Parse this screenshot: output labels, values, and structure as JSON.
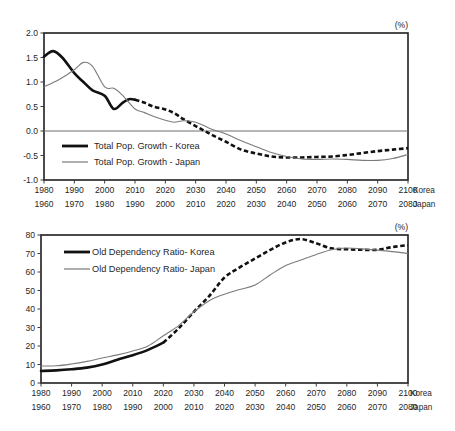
{
  "chart_data": [
    {
      "id": "total-population-growth",
      "type": "line",
      "title": "",
      "unit_label": "(%)",
      "xlabel": "",
      "ylabel": "",
      "ylim": [
        -1.0,
        2.0
      ],
      "yticks": [
        -1.0,
        -0.5,
        0.0,
        0.5,
        1.0,
        1.5,
        2.0
      ],
      "ytick_labels": [
        "-1.0",
        "-0.5",
        "0.0",
        "0.5",
        "1.0",
        "1.5",
        "2.0"
      ],
      "grid": false,
      "zero_line": true,
      "legend_position": "inside-lower-left",
      "x_axis_korea": {
        "label": "Korea",
        "ticks": [
          1980,
          1990,
          2000,
          2010,
          2020,
          2030,
          2040,
          2050,
          2060,
          2070,
          2080,
          2090,
          2100
        ],
        "tick_labels": [
          "1980",
          "1990",
          "2000",
          "2010",
          "2020",
          "2030",
          "2040",
          "2050",
          "2060",
          "2070",
          "2080",
          "2090",
          "2100"
        ]
      },
      "x_axis_japan": {
        "label": "Japan",
        "ticks": [
          1960,
          1970,
          1980,
          1990,
          2000,
          2010,
          2020,
          2030,
          2040,
          2050,
          2060,
          2070,
          2080
        ],
        "tick_labels": [
          "1960",
          "1970",
          "1980",
          "1990",
          "2000",
          "2010",
          "2020",
          "2030",
          "2040",
          "2050",
          "2060",
          "2070",
          "2080"
        ]
      },
      "series": [
        {
          "name": "Total Pop. Growth - Korea",
          "style": "thick-black",
          "observed_until": 2010,
          "x": [
            1980,
            1983,
            1986,
            1990,
            1993,
            1996,
            2000,
            2003,
            2006,
            2008,
            2010,
            2013,
            2016,
            2020,
            2023,
            2026,
            2030,
            2033,
            2036,
            2040,
            2045,
            2050,
            2055,
            2060,
            2065,
            2070,
            2075,
            2080,
            2085,
            2090,
            2095,
            2100
          ],
          "values": [
            1.52,
            1.63,
            1.5,
            1.18,
            1.0,
            0.83,
            0.72,
            0.45,
            0.58,
            0.65,
            0.64,
            0.58,
            0.5,
            0.44,
            0.36,
            0.24,
            0.1,
            0.0,
            -0.1,
            -0.22,
            -0.38,
            -0.46,
            -0.52,
            -0.54,
            -0.54,
            -0.53,
            -0.52,
            -0.49,
            -0.45,
            -0.41,
            -0.38,
            -0.35
          ]
        },
        {
          "name": "Total Pop. Growth - Japan",
          "style": "thin-gray",
          "x": [
            1960,
            1965,
            1970,
            1973,
            1976,
            1980,
            1983,
            1986,
            1990,
            1993,
            1996,
            2000,
            2003,
            2006,
            2010,
            2013,
            2016,
            2020,
            2025,
            2030,
            2035,
            2040,
            2045,
            2050,
            2055,
            2060,
            2065,
            2070,
            2075,
            2080
          ],
          "values": [
            0.9,
            1.05,
            1.25,
            1.4,
            1.32,
            0.9,
            0.87,
            0.72,
            0.45,
            0.38,
            0.3,
            0.22,
            0.18,
            0.21,
            0.18,
            0.1,
            0.02,
            -0.06,
            -0.2,
            -0.32,
            -0.44,
            -0.52,
            -0.57,
            -0.58,
            -0.57,
            -0.58,
            -0.6,
            -0.6,
            -0.56,
            -0.48
          ]
        }
      ],
      "legend": [
        {
          "label": "Total Pop. Growth - Korea",
          "style": "thick-black"
        },
        {
          "label": "Total Pop. Growth - Japan",
          "style": "thin-gray"
        }
      ]
    },
    {
      "id": "old-dependency-ratio",
      "type": "line",
      "title": "",
      "unit_label": "(%)",
      "xlabel": "",
      "ylabel": "",
      "ylim": [
        0,
        80
      ],
      "yticks": [
        0,
        10,
        20,
        30,
        40,
        50,
        60,
        70,
        80
      ],
      "ytick_labels": [
        "0",
        "10",
        "20",
        "30",
        "40",
        "50",
        "60",
        "70",
        "80"
      ],
      "grid": false,
      "zero_line": false,
      "legend_position": "inside-upper-left",
      "x_axis_korea": {
        "label": "Korea",
        "ticks": [
          1980,
          1990,
          2000,
          2010,
          2020,
          2030,
          2040,
          2050,
          2060,
          2070,
          2080,
          2090,
          2100
        ],
        "tick_labels": [
          "1980",
          "1990",
          "2000",
          "2010",
          "2020",
          "2030",
          "2040",
          "2050",
          "2060",
          "2070",
          "2080",
          "2090",
          "2100"
        ]
      },
      "x_axis_japan": {
        "label": "Japan",
        "ticks": [
          1960,
          1970,
          1980,
          1990,
          2000,
          2010,
          2020,
          2030,
          2040,
          2050,
          2060,
          2070,
          2080
        ],
        "tick_labels": [
          "1960",
          "1970",
          "1980",
          "1990",
          "2000",
          "2010",
          "2020",
          "2030",
          "2040",
          "2050",
          "2060",
          "2070",
          "2080"
        ]
      },
      "series": [
        {
          "name": "Old Dependency Ratio- Korea",
          "style": "thick-black",
          "observed_until": 2020,
          "x": [
            1980,
            1985,
            1990,
            1995,
            2000,
            2005,
            2010,
            2015,
            2020,
            2025,
            2030,
            2035,
            2040,
            2045,
            2050,
            2055,
            2060,
            2065,
            2070,
            2075,
            2080,
            2085,
            2090,
            2095,
            2100
          ],
          "values": [
            6.5,
            6.8,
            7.4,
            8.3,
            10.0,
            12.6,
            15.0,
            17.9,
            21.8,
            29.5,
            38.5,
            47.0,
            57.0,
            62.5,
            67.3,
            72.0,
            76.0,
            77.8,
            75.5,
            72.8,
            72.3,
            72.0,
            72.0,
            73.5,
            74.5
          ]
        },
        {
          "name": "Old Dependency Ratio- Japan",
          "style": "thin-gray",
          "x": [
            1960,
            1965,
            1970,
            1975,
            1980,
            1985,
            1990,
            1995,
            2000,
            2005,
            2010,
            2015,
            2020,
            2025,
            2030,
            2035,
            2040,
            2045,
            2050,
            2055,
            2060,
            2065,
            2070,
            2075,
            2080
          ],
          "values": [
            9.2,
            9.3,
            10.3,
            11.7,
            13.5,
            15.2,
            17.3,
            20.0,
            25.5,
            31.0,
            38.5,
            44.5,
            48.0,
            50.5,
            53.0,
            58.5,
            63.5,
            66.5,
            69.5,
            72.0,
            73.0,
            72.5,
            71.8,
            71.0,
            70.0
          ]
        }
      ],
      "legend": [
        {
          "label": "Old Dependency Ratio- Korea",
          "style": "thick-black"
        },
        {
          "label": "Old Dependency Ratio- Japan",
          "style": "thin-gray"
        }
      ]
    }
  ],
  "colors": {
    "korea_line": "#111111",
    "japan_line": "#7b7b7b",
    "axis": "#1f1f1f",
    "zero_line": "#6e6e6e",
    "background": "#ffffff"
  }
}
